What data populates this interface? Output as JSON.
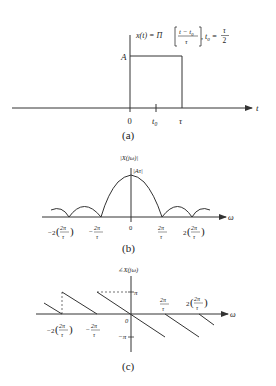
{
  "panel_a": {
    "caption": "(a)",
    "formula_lhs": "x(t) = Π",
    "formula_num": "t − t",
    "formula_num_sub": "0",
    "formula_den": "τ",
    "formula_mid": ", t",
    "formula_mid_sub": "0",
    "formula_eq": " = ",
    "formula_frac_num": "τ",
    "formula_frac_den": "2",
    "amplitude_label": "A",
    "x_axis_label": "t",
    "ticks": [
      "0",
      "t",
      "τ"
    ],
    "tick_t0_sub": "0"
  },
  "panel_b": {
    "caption": "(b)",
    "y_label": "|X(jω)|",
    "peak_label": "|Aτ|",
    "x_axis_label": "ω",
    "tick_zero": "0",
    "tick_neg2_prefix": "−2",
    "tick_neg1_prefix": "−",
    "tick_pos2_prefix": "2",
    "frac_num": "2π",
    "frac_den": "τ"
  },
  "panel_c": {
    "caption": "(c)",
    "y_label": "∠X(jω)",
    "x_axis_label": "ω",
    "pi_label": "π",
    "neg_pi_label": "−π",
    "tick_zero": "0",
    "tick_neg2_prefix": "−2",
    "tick_neg1_prefix": "−",
    "tick_pos2_prefix": "2",
    "frac_num": "2π",
    "frac_den": "τ"
  }
}
